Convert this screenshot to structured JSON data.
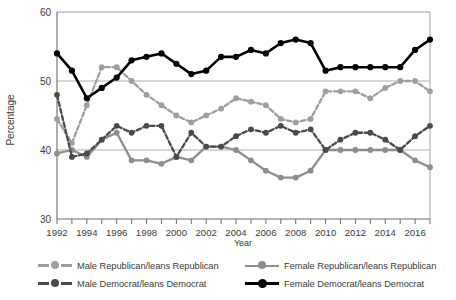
{
  "chart_data": {
    "type": "line",
    "title": "",
    "xlabel": "Year",
    "ylabel": "Percentage",
    "ylim": [
      30,
      60
    ],
    "yticks": [
      30,
      40,
      50,
      60
    ],
    "xlim": [
      1992,
      2017
    ],
    "xticks_labeled": [
      1992,
      1994,
      1996,
      1998,
      2000,
      2002,
      2004,
      2006,
      2008,
      2010,
      2012,
      2014,
      2016
    ],
    "grid": "horizontal",
    "legend_position": "below",
    "x": [
      1992,
      1993,
      1994,
      1995,
      1996,
      1997,
      1998,
      1999,
      2000,
      2001,
      2002,
      2003,
      2004,
      2005,
      2006,
      2007,
      2008,
      2009,
      2010,
      2011,
      2012,
      2013,
      2014,
      2015,
      2016,
      2017
    ],
    "series": [
      {
        "name": "Male Republican/leans Republican",
        "color": "#9e9e9e",
        "style": "dashed",
        "values": [
          44.5,
          41.0,
          46.5,
          52.0,
          52.0,
          50.0,
          48.0,
          46.5,
          45.0,
          44.0,
          45.0,
          46.0,
          47.5,
          47.0,
          46.5,
          44.5,
          44.0,
          44.5,
          48.5,
          48.5,
          48.5,
          47.5,
          49.0,
          50.0,
          50.0,
          48.5
        ]
      },
      {
        "name": "Female Republican/leans Republican",
        "color": "#8d8d8d",
        "style": "solid",
        "values": [
          39.5,
          40.0,
          39.0,
          41.5,
          42.5,
          38.5,
          38.5,
          38.0,
          39.0,
          38.5,
          40.5,
          40.5,
          40.0,
          38.5,
          37.0,
          36.0,
          36.0,
          37.0,
          40.0,
          40.0,
          40.0,
          40.0,
          40.0,
          40.0,
          38.5,
          37.5
        ]
      },
      {
        "name": "Male Democrat/leans Democrat",
        "color": "#4a4a4a",
        "style": "dashed",
        "values": [
          48.0,
          39.0,
          39.5,
          41.5,
          43.5,
          42.5,
          43.5,
          43.5,
          39.0,
          42.5,
          40.5,
          40.5,
          42.0,
          43.0,
          42.5,
          43.5,
          42.5,
          43.0,
          40.0,
          41.5,
          42.5,
          42.5,
          41.5,
          40.0,
          42.0,
          43.5
        ]
      },
      {
        "name": "Female Democrat/leans Democrat",
        "color": "#000000",
        "style": "solid",
        "values": [
          54.0,
          51.5,
          47.5,
          49.0,
          50.5,
          53.0,
          53.5,
          54.0,
          52.5,
          51.0,
          51.5,
          53.5,
          53.5,
          54.5,
          54.0,
          55.5,
          56.0,
          55.5,
          51.5,
          52.0,
          52.0,
          52.0,
          52.0,
          52.0,
          54.5,
          56.0
        ]
      }
    ]
  },
  "axes": {
    "ylabel": "Percentage",
    "xlabel": "Year",
    "ytick_labels": [
      "60",
      "50",
      "40",
      "30"
    ],
    "xtick_labels": [
      "1992",
      "1994",
      "1996",
      "1998",
      "2000",
      "2002",
      "2004",
      "2006",
      "2008",
      "2010",
      "2012",
      "2014",
      "2016"
    ]
  },
  "legend": {
    "items": [
      {
        "label": "Male Republican/leans Republican",
        "color": "#9e9e9e",
        "style": "dashed"
      },
      {
        "label": "Female Republican/leans Republican",
        "color": "#8d8d8d",
        "style": "solid"
      },
      {
        "label": "Male Democrat/leans Democrat",
        "color": "#4a4a4a",
        "style": "dashed"
      },
      {
        "label": "Female Democrat/leans Democrat",
        "color": "#000000",
        "style": "solid"
      }
    ]
  }
}
